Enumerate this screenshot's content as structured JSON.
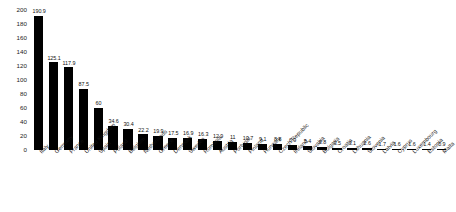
{
  "chart_data": {
    "type": "bar",
    "title": "",
    "subtitle": "",
    "xlabel": "",
    "ylabel": "",
    "ylim": [
      0,
      200
    ],
    "yticks": [
      200,
      180,
      160,
      140,
      120,
      100,
      80,
      60,
      40,
      20,
      0
    ],
    "grid": false,
    "legend": null,
    "bar_color": "#000000",
    "categories": [
      "Italy",
      "Germany",
      "France",
      "United Kingdom",
      "Spain",
      "Poland",
      "Belgium",
      "Netherlands",
      "Greece",
      "Denmark",
      "Sweden",
      "Romania",
      "Austria",
      "Portugal",
      "Finland",
      "Hungary",
      "Czech Republic",
      "Ireland",
      "Slovakia",
      "Bulgaria",
      "Croatia",
      "Lithuania",
      "Slovenia",
      "Latvia",
      "Cyprus",
      "Luxembourg",
      "Estonia",
      "Malta"
    ],
    "values": [
      190.9,
      125.1,
      117.9,
      87.5,
      60,
      34.6,
      30.4,
      22.2,
      19.9,
      17.5,
      16.9,
      16.3,
      12.9,
      11,
      10.7,
      9.1,
      8.8,
      6.9,
      5.4,
      3.8,
      3.5,
      3.1,
      2.6,
      1.7,
      1.6,
      1.6,
      1.4,
      0.9
    ],
    "value_labels": [
      "190.9",
      "125.1",
      "117.9",
      "87.5",
      "60",
      "34.6",
      "30.4",
      "22.2",
      "19.9",
      "17.5",
      "16.9",
      "16.3",
      "12.9",
      "11",
      "10.7",
      "9.1",
      "8.8",
      "6.9",
      "5.4",
      "3.8",
      "3.5",
      "3.1",
      "2.6",
      "1.7",
      "1.6",
      "1.6",
      "1.4",
      "0.9"
    ]
  }
}
